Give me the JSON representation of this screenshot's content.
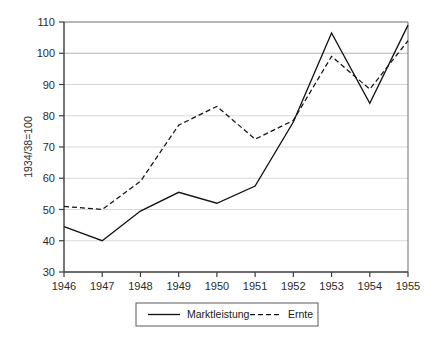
{
  "chart_data": {
    "type": "line",
    "title": "",
    "subtitle": "",
    "xlabel": "",
    "ylabel": "1934/38=100",
    "x": [
      1946,
      1947,
      1948,
      1949,
      1950,
      1951,
      1952,
      1953,
      1954,
      1955
    ],
    "xtick_labels": [
      "1946",
      "1947",
      "1948",
      "1949",
      "1950",
      "1951",
      "1952",
      "1953",
      "1954",
      "1955"
    ],
    "ytick_labels": [
      "30",
      "40",
      "50",
      "60",
      "70",
      "80",
      "90",
      "100",
      "110"
    ],
    "yticks": [
      30,
      40,
      50,
      60,
      70,
      80,
      90,
      100,
      110
    ],
    "ylim": [
      30,
      110
    ],
    "xlim": [
      1946,
      1955
    ],
    "grid": true,
    "grid_axis": "y",
    "legend_position": "bottom",
    "series": [
      {
        "name": "Marktleistung",
        "style": "solid",
        "color": "#141414",
        "values": [
          44.5,
          40.0,
          49.5,
          55.5,
          52.0,
          57.5,
          78.0,
          106.5,
          84.0,
          109.0
        ]
      },
      {
        "name": "Ernte",
        "style": "dashed",
        "color": "#141414",
        "values": [
          51.0,
          50.0,
          59.0,
          77.0,
          83.0,
          72.5,
          78.5,
          99.0,
          88.5,
          104.0
        ]
      }
    ]
  },
  "legend": {
    "items": [
      {
        "label": "Marktleistung",
        "style": "solid"
      },
      {
        "label": "Ernte",
        "style": "dashed"
      }
    ]
  },
  "axes": {
    "y_axis_title": "1934/38=100"
  }
}
